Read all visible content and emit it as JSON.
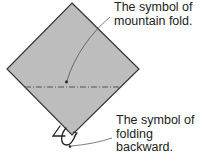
{
  "diagram": {
    "type": "origami-instruction",
    "paper": {
      "shape": "diamond",
      "fill_color": "#bdbdbd",
      "edge_color": "#333333"
    },
    "fold_line": {
      "style": "dash-dot",
      "kind": "mountain fold",
      "color": "#555555"
    },
    "annotations": [
      {
        "id": "mountain-fold",
        "lines": [
          "The symbol of",
          "mountain fold."
        ],
        "points_to": "dashed fold line"
      },
      {
        "id": "folding-backward",
        "lines": [
          "The symbol of",
          "folding",
          "backward."
        ],
        "points_to": "fold-backward arrow at bottom corner"
      }
    ]
  }
}
